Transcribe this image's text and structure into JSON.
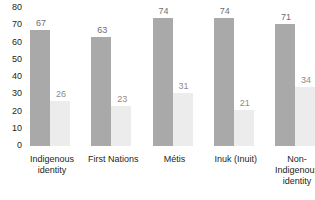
{
  "chart_data": {
    "type": "bar",
    "title": "",
    "xlabel": "",
    "ylabel": "",
    "ylim": [
      0,
      80
    ],
    "grid": false,
    "legend": "none",
    "categories": [
      "Indigenous identity",
      "First Nations",
      "Métis",
      "Inuk (Inuit)",
      "Non-Indigenous identity"
    ],
    "category_lines": [
      [
        "Indigenous",
        "identity"
      ],
      [
        "First Nations"
      ],
      [
        "Métis"
      ],
      [
        "Inuk (Inuit)"
      ],
      [
        "Non-",
        "Indigenous",
        "identity"
      ]
    ],
    "y_ticks": [
      "0",
      "10",
      "20",
      "30",
      "40",
      "50",
      "60",
      "70",
      "80"
    ],
    "series": [
      {
        "name": "series-1",
        "color": "#a9a9a9",
        "values": [
          67,
          63,
          74,
          74,
          71
        ],
        "labels": [
          "67",
          "63",
          "74",
          "74",
          "71"
        ]
      },
      {
        "name": "series-2",
        "color": "#ececec",
        "values": [
          26,
          23,
          31,
          21,
          34
        ],
        "labels": [
          "26",
          "23",
          "31",
          "21",
          "34"
        ]
      }
    ]
  }
}
